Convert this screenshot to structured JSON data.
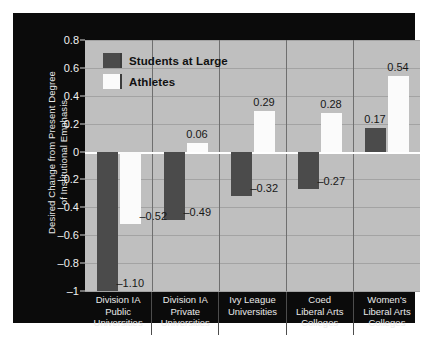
{
  "chart_data": {
    "type": "bar",
    "title": "",
    "xlabel": "",
    "ylabel": "Desired Change from Present Degree of Institutional Emphasis",
    "ylabel_lines": [
      "Desired Change from Present Degree",
      "of Institutional Emphasis"
    ],
    "ylim": [
      -1,
      0.8
    ],
    "yticks": [
      0.8,
      0.6,
      0.4,
      0.2,
      0,
      -0.2,
      -0.4,
      -0.6,
      -0.8,
      -1
    ],
    "ytick_labels": [
      "0.8",
      "0.6",
      "0.4",
      "0.2",
      "0",
      "–0.2",
      "–0.4",
      "–0.6",
      "–0.8",
      "–1"
    ],
    "grid": true,
    "legend_position": "top-left",
    "categories": [
      "Division IA Public Universities",
      "Division IA Private Universities",
      "Ivy League Universities",
      "Coed Liberal Arts Colleges",
      "Women's Liberal Arts Colleges"
    ],
    "category_lines": [
      [
        "Division IA",
        "Public",
        "Universities"
      ],
      [
        "Division IA",
        "Private",
        "Universities"
      ],
      [
        "Ivy League",
        "Universities"
      ],
      [
        "Coed",
        "Liberal Arts",
        "Colleges"
      ],
      [
        "Women's",
        "Liberal Arts",
        "Colleges"
      ]
    ],
    "series": [
      {
        "name": "Students at Large",
        "color": "#4b4b4b",
        "values": [
          -1.1,
          -0.49,
          -0.32,
          -0.27,
          0.17
        ],
        "value_labels": [
          "–1.10",
          "–0.49",
          "–0.32",
          "–0.27",
          "0.17"
        ]
      },
      {
        "name": "Athletes",
        "color": "#fbfbfb",
        "values": [
          -0.52,
          0.06,
          0.29,
          0.28,
          0.54
        ],
        "value_labels": [
          "–0.52",
          "0.06",
          "0.29",
          "0.28",
          "0.54"
        ]
      }
    ]
  },
  "legend": {
    "items": [
      {
        "label": "Students at Large",
        "swatch": "dark"
      },
      {
        "label": "Athletes",
        "swatch": "light"
      }
    ]
  },
  "colors": {
    "panel_background": "#0b0b0b",
    "plot_background": "#bfbfbf",
    "gridline": "#a3a3a3",
    "zero_line": "#ffffff",
    "dark_series": "#4b4b4b",
    "light_series": "#fbfbfb",
    "axis_text": "#f0f0f0",
    "value_label_text": "#171717"
  }
}
